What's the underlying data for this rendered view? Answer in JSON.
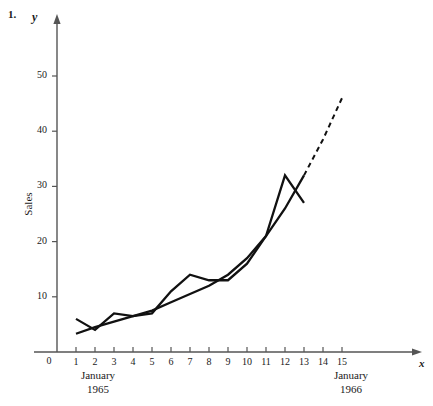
{
  "problem_number": "1.",
  "axis_labels": {
    "x_symbol": "x",
    "y_symbol": "y",
    "y_title": "Sales",
    "origin": "0"
  },
  "period_labels": {
    "start_month": "January",
    "start_year": "1965",
    "end_month": "January",
    "end_year": "1966"
  },
  "colors": {
    "series": "#111111",
    "axis": "#555555",
    "background": "#ffffff"
  },
  "chart_data": {
    "type": "line",
    "title": "",
    "subtitle": "",
    "xlabel": "x",
    "ylabel": "Sales",
    "xlim": [
      0,
      16
    ],
    "ylim": [
      0,
      56
    ],
    "grid": false,
    "legend": "none",
    "x": [
      1,
      2,
      3,
      4,
      5,
      6,
      7,
      8,
      9,
      10,
      11,
      12,
      13
    ],
    "xticks": [
      1,
      2,
      3,
      4,
      5,
      6,
      7,
      8,
      9,
      10,
      11,
      12,
      13,
      14,
      15
    ],
    "xticklabels": [
      "1",
      "2",
      "3",
      "4",
      "5",
      "6",
      "7",
      "8",
      "9",
      "10",
      "11",
      "12",
      "13",
      "14",
      "15"
    ],
    "yticks": [
      10,
      20,
      30,
      40,
      50
    ],
    "yticklabels": [
      "10",
      "20",
      "30",
      "40",
      "50"
    ],
    "series": [
      {
        "name": "Actual sales",
        "style": "solid",
        "values": [
          6,
          4,
          7,
          6.5,
          7,
          11,
          14,
          13,
          13,
          16,
          21,
          32,
          27
        ]
      },
      {
        "name": "Trend curve",
        "style": "solid",
        "values": [
          3.3,
          4.5,
          5.5,
          6.5,
          7.5,
          9,
          10.5,
          12,
          14,
          17,
          21,
          26,
          32
        ]
      },
      {
        "name": "Trend forecast",
        "style": "dashed",
        "x": [
          13,
          14,
          15
        ],
        "values": [
          32,
          38.5,
          46
        ]
      }
    ],
    "annotations": [
      {
        "text": "January 1965",
        "x": 1,
        "position": "below-axis"
      },
      {
        "text": "January 1966",
        "x": 13,
        "position": "below-axis"
      }
    ]
  }
}
